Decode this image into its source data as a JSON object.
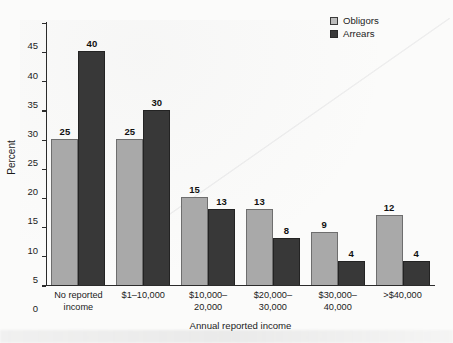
{
  "chart_data": {
    "type": "bar",
    "title": "",
    "xlabel": "Annual reported income",
    "ylabel": "Percent",
    "ylim": [
      0,
      45
    ],
    "ytick_step": 5,
    "yticks": [
      0,
      5,
      10,
      15,
      20,
      25,
      30,
      35,
      40,
      45
    ],
    "grid": false,
    "legend_position": "top-right",
    "categories": [
      "No reported\nincome",
      "$1–10,000",
      "$10,000–\n20,000",
      "$20,000–\n30,000",
      "$30,000–\n40,000",
      ">$40,000"
    ],
    "series": [
      {
        "name": "Obligors",
        "color": "#a9a9a9",
        "values": [
          25,
          25,
          15,
          13,
          9,
          12
        ]
      },
      {
        "name": "Arrears",
        "color": "#383838",
        "values": [
          40,
          30,
          13,
          8,
          4,
          4
        ]
      }
    ]
  },
  "legend": {
    "items": [
      {
        "label": "Obligors"
      },
      {
        "label": "Arrears"
      }
    ]
  }
}
